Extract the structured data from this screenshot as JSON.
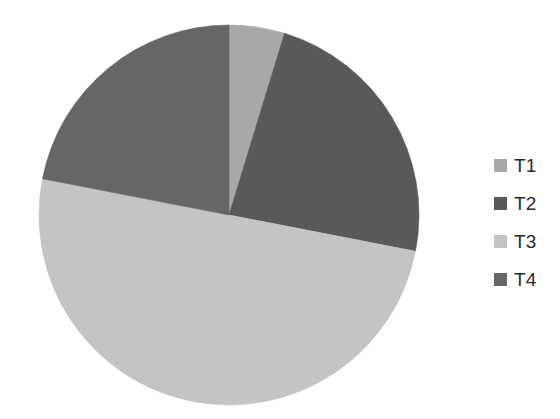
{
  "chart_data": {
    "type": "pie",
    "title": "",
    "subtitle": "",
    "xlabel": "",
    "ylabel": "",
    "grid": false,
    "legend_position": "right",
    "start_angle_deg": 0,
    "direction": "clockwise",
    "categories": [
      "T1",
      "T2",
      "T3",
      "T4"
    ],
    "values": [
      4.7,
      23.3,
      50.0,
      22.0
    ],
    "unit": "percent",
    "colors": [
      "#a8a8a8",
      "#595959",
      "#c4c4c4",
      "#666666"
    ],
    "slices": [
      {
        "label": "T1",
        "value": 4.7,
        "color": "#a8a8a8",
        "start_deg": 0.0,
        "end_deg": 17.0
      },
      {
        "label": "T2",
        "value": 23.3,
        "color": "#595959",
        "start_deg": 17.0,
        "end_deg": 101.0
      },
      {
        "label": "T3",
        "value": 50.0,
        "color": "#c4c4c4",
        "start_deg": 101.0,
        "end_deg": 281.0
      },
      {
        "label": "T4",
        "value": 22.0,
        "color": "#666666",
        "start_deg": 281.0,
        "end_deg": 360.0
      }
    ],
    "geometry": {
      "center_x": 229,
      "center_y": 215,
      "radius": 190
    }
  },
  "legend": {
    "items": [
      {
        "label": "T1",
        "swatch_color": "#a8a8a8",
        "swatch_icon": "legend-square-icon"
      },
      {
        "label": "T2",
        "swatch_color": "#595959",
        "swatch_icon": "legend-square-icon"
      },
      {
        "label": "T3",
        "swatch_color": "#c4c4c4",
        "swatch_icon": "legend-square-icon"
      },
      {
        "label": "T4",
        "swatch_color": "#666666",
        "swatch_icon": "legend-square-icon"
      }
    ]
  },
  "background_color": "#ffffff"
}
